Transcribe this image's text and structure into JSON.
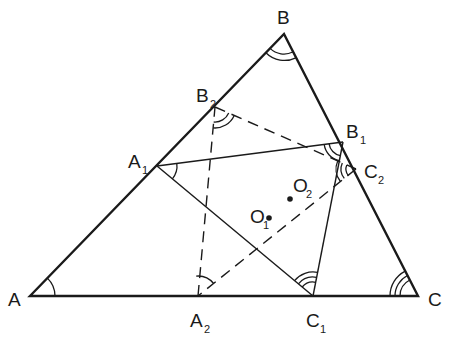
{
  "figure": {
    "colors": {
      "ink": "#1a1a1a",
      "background": "#ffffff"
    }
  },
  "points": {
    "A": {
      "label": "A",
      "sub": "",
      "x": 30,
      "y": 296
    },
    "B": {
      "label": "B",
      "sub": "",
      "x": 284,
      "y": 34
    },
    "C": {
      "label": "C",
      "sub": "",
      "x": 418,
      "y": 296
    },
    "A1": {
      "label": "A",
      "sub": "1",
      "x": 157,
      "y": 166
    },
    "B1": {
      "label": "B",
      "sub": "1",
      "x": 343,
      "y": 142
    },
    "C1": {
      "label": "C",
      "sub": "1",
      "x": 313,
      "y": 296
    },
    "A2": {
      "label": "A",
      "sub": "2",
      "x": 198,
      "y": 296
    },
    "B2": {
      "label": "B",
      "sub": "2",
      "x": 215,
      "y": 107
    },
    "C2": {
      "label": "C",
      "sub": "2",
      "x": 356,
      "y": 169
    },
    "O1": {
      "label": "O",
      "sub": "1",
      "x": 269,
      "y": 218
    },
    "O2": {
      "label": "O",
      "sub": "2",
      "x": 290,
      "y": 199
    }
  },
  "segments": {
    "outer_triangle": [
      "A-B",
      "B-C",
      "C-A"
    ],
    "solid_triangle_A1B1C1": [
      "A1-B1",
      "B1-C1",
      "C1-A1"
    ],
    "dashed_triangle_A2B2C2": [
      "A2-B2",
      "B2-C2",
      "C2-A2"
    ]
  },
  "angle_marks": [
    {
      "vertex": "A",
      "arcs": 1
    },
    {
      "vertex": "B",
      "arcs": 2
    },
    {
      "vertex": "C",
      "arcs": 3
    },
    {
      "vertex": "A1",
      "arcs": 1
    },
    {
      "vertex": "B1",
      "arcs": 2
    },
    {
      "vertex": "C1",
      "arcs": 3
    },
    {
      "vertex": "A2",
      "arcs": 1
    },
    {
      "vertex": "B2",
      "arcs": 2
    },
    {
      "vertex": "C2",
      "arcs": 3
    }
  ]
}
